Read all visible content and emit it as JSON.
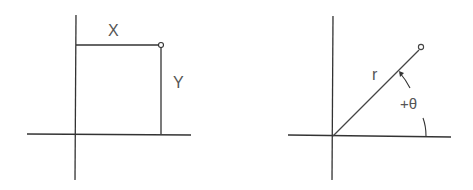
{
  "diagrams": [
    {
      "name": "cartesian-coordinates",
      "labels": {
        "x": "X",
        "y": "Y"
      }
    },
    {
      "name": "polar-coordinates",
      "labels": {
        "radius": "r",
        "angle": "+θ"
      }
    }
  ],
  "colors": {
    "line": "#333333",
    "text": "#555555",
    "background": "#ffffff"
  }
}
